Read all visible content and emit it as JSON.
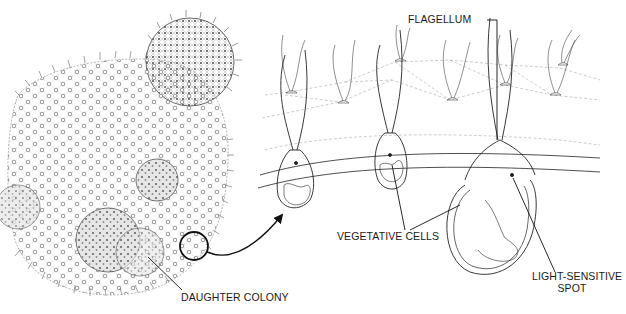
{
  "diagram": {
    "colors": {
      "ink": "#1a1a1a",
      "faint": "#9a9a9a",
      "background": "#ffffff"
    },
    "labels": {
      "flagellum": "FLAGELLUM",
      "vegetative_cells": "VEGETATIVE CELLS",
      "light_sensitive_spot_line1": "LIGHT-SENSITIVE",
      "light_sensitive_spot_line2": "SPOT",
      "daughter_colony": "DAUGHTER COLONY"
    }
  }
}
